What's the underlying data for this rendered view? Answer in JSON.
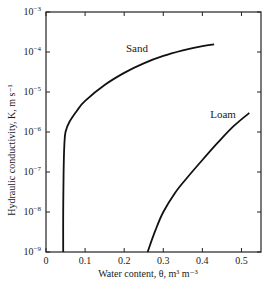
{
  "chart_data": {
    "type": "line",
    "title": "",
    "xlabel": "Water content, θ, m³ m⁻³",
    "ylabel": "Hydraulic conductivity, K, m s⁻¹",
    "xlim": [
      0,
      0.55
    ],
    "ylim": [
      1e-09,
      0.001
    ],
    "yscale": "log",
    "grid": false,
    "legend": "inline labels",
    "x_ticks": [
      "0",
      "0.1",
      "0.2",
      "0.3",
      "0.4",
      "0.5"
    ],
    "x_tick_values": [
      0,
      0.1,
      0.2,
      0.3,
      0.4,
      0.5
    ],
    "y_ticks": [
      {
        "base": "10",
        "exp": "−3",
        "value": 0.001
      },
      {
        "base": "10",
        "exp": "−4",
        "value": 0.0001
      },
      {
        "base": "10",
        "exp": "−5",
        "value": 1e-05
      },
      {
        "base": "10",
        "exp": "−6",
        "value": 1e-06
      },
      {
        "base": "10",
        "exp": "−7",
        "value": 1e-07
      },
      {
        "base": "10",
        "exp": "−8",
        "value": 1e-08
      },
      {
        "base": "10",
        "exp": "−9",
        "value": 1e-09
      }
    ],
    "series": [
      {
        "name": "Sand",
        "x": [
          0.044,
          0.044,
          0.045,
          0.047,
          0.05,
          0.06,
          0.08,
          0.1,
          0.15,
          0.2,
          0.25,
          0.3,
          0.35,
          0.4,
          0.43
        ],
        "y": [
          1e-09,
          1e-08,
          1e-07,
          5e-07,
          1e-06,
          1.8e-06,
          3.5e-06,
          6e-06,
          1.5e-05,
          3e-05,
          5.2e-05,
          8e-05,
          0.00011,
          0.00014,
          0.000155
        ]
      },
      {
        "name": "Loam",
        "x": [
          0.26,
          0.28,
          0.3,
          0.33,
          0.36,
          0.4,
          0.44,
          0.48,
          0.52
        ],
        "y": [
          1e-09,
          3.5e-09,
          1e-08,
          3e-08,
          7e-08,
          2e-07,
          5.5e-07,
          1.4e-06,
          3e-06
        ]
      }
    ],
    "annotations": [
      {
        "text": "Sand",
        "x": 0.24,
        "y": 0.00014
      },
      {
        "text": "Loam",
        "x": 0.44,
        "y": 2.2e-06
      }
    ]
  },
  "axes": {
    "xlabel": "Water content, θ, m³ m⁻³",
    "ylabel": "Hydraulic conductivity, K, m s⁻¹"
  },
  "labels": {
    "sand": "Sand",
    "loam": "Loam"
  },
  "colors": {
    "line": "#111111",
    "axis": "#222222",
    "background": "#ffffff"
  }
}
